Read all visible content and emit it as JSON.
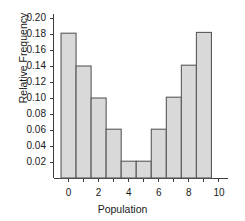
{
  "chart_data": {
    "type": "bar",
    "title": "",
    "subtitle": "",
    "xlabel": "Population",
    "ylabel": "Relative Frequency",
    "categories": [
      "0",
      "1",
      "2",
      "3",
      "4",
      "5",
      "6",
      "7",
      "8",
      "9"
    ],
    "values": [
      0.181,
      0.14,
      0.1,
      0.061,
      0.021,
      0.021,
      0.061,
      0.101,
      0.141,
      0.182
    ],
    "bin_edges": [
      -0.5,
      0.5,
      1.5,
      2.5,
      3.5,
      4.5,
      5.5,
      6.5,
      7.5,
      8.5,
      9.5
    ],
    "xlim": [
      -1.0,
      10.6
    ],
    "ylim": [
      0.0,
      0.205
    ],
    "xticks": [
      0,
      1,
      2,
      3,
      4,
      5,
      6,
      7,
      8,
      9,
      10
    ],
    "xtick_labels": [
      "0",
      "",
      "2",
      "",
      "4",
      "",
      "6",
      "",
      "8",
      "",
      "10"
    ],
    "yticks": [
      0.02,
      0.04,
      0.06,
      0.08,
      0.1,
      0.12,
      0.14,
      0.16,
      0.18,
      0.2
    ],
    "ytick_labels": [
      "0.02",
      "0.04",
      "0.06",
      "0.08",
      "0.10",
      "0.12",
      "0.14",
      "0.16",
      "0.18",
      "0.20"
    ],
    "grid": false,
    "legend": null,
    "legend_position": "none",
    "annotations": [],
    "colors": {
      "bar_fill": "#d9d9d9",
      "bar_edge": "#5a5a5a",
      "axis": "#3d3d3d",
      "text": "#1a1a1a",
      "background": "#ffffff"
    }
  }
}
